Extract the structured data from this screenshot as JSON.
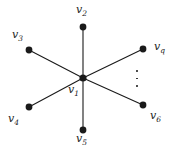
{
  "figure": {
    "kind": "star-graph",
    "width": 173,
    "height": 151,
    "background_color": "#ffffff",
    "ink_color": "#1a1a1a"
  },
  "nodes": [
    {
      "id": "v1",
      "label_text": "v",
      "label_sub": "1",
      "cx": 83,
      "cy": 78,
      "label_x": 68,
      "label_y": 84,
      "role": "center"
    },
    {
      "id": "v2",
      "label_text": "v",
      "label_sub": "2",
      "cx": 83,
      "cy": 27,
      "label_x": 76,
      "label_y": 4,
      "role": "leaf"
    },
    {
      "id": "v3",
      "label_text": "v",
      "label_sub": "3",
      "cx": 29,
      "cy": 50,
      "label_x": 12,
      "label_y": 29,
      "role": "leaf"
    },
    {
      "id": "v4",
      "label_text": "v",
      "label_sub": "4",
      "cx": 29,
      "cy": 107,
      "label_x": 8,
      "label_y": 113,
      "role": "leaf"
    },
    {
      "id": "v5",
      "label_text": "v",
      "label_sub": "5",
      "cx": 83,
      "cy": 130,
      "label_x": 76,
      "label_y": 133,
      "role": "leaf"
    },
    {
      "id": "vq",
      "label_text": "v",
      "label_sub": "q",
      "cx": 143,
      "cy": 49,
      "label_x": 154,
      "label_y": 41,
      "role": "leaf"
    },
    {
      "id": "v6",
      "label_text": "v",
      "label_sub": "6",
      "cx": 143,
      "cy": 105,
      "label_x": 150,
      "label_y": 110,
      "role": "leaf"
    }
  ],
  "edges": [
    {
      "from": "v1",
      "to": "v2"
    },
    {
      "from": "v1",
      "to": "v3"
    },
    {
      "from": "v1",
      "to": "v4"
    },
    {
      "from": "v1",
      "to": "v5"
    },
    {
      "from": "v1",
      "to": "vq"
    },
    {
      "from": "v1",
      "to": "v6"
    }
  ],
  "ellipsis": {
    "name": "vertical-ellipsis",
    "dot_count": 3,
    "x": 136,
    "y": 70
  },
  "style": {
    "vertex_radius": 3.4,
    "center_vertex_radius": 3.6,
    "edge_width": 1.1
  }
}
